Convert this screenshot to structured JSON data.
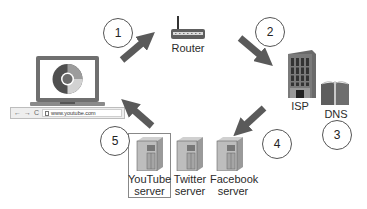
{
  "diagram": {
    "nodes": {
      "laptop": {
        "label": "",
        "icon": "chrome-browser-icon"
      },
      "browser": {
        "nav_buttons": [
          "←",
          "→",
          "C"
        ],
        "url": "www.youtube.com"
      },
      "router": {
        "label": "Router"
      },
      "isp": {
        "label": "ISP"
      },
      "dns": {
        "label": "DNS"
      },
      "servers": [
        {
          "line1": "YouTube",
          "line2": "server",
          "highlighted": true
        },
        {
          "line1": "Twitter",
          "line2": "server",
          "highlighted": false
        },
        {
          "line1": "Facebook",
          "line2": "server",
          "highlighted": false
        }
      ]
    },
    "steps": [
      {
        "number": "1",
        "from": "laptop",
        "to": "router"
      },
      {
        "number": "2",
        "from": "router",
        "to": "isp"
      },
      {
        "number": "3",
        "from": "isp",
        "to": "dns"
      },
      {
        "number": "4",
        "from": "isp",
        "to": "servers"
      },
      {
        "number": "5",
        "from": "servers",
        "to": "browser"
      }
    ],
    "colors": {
      "arrow": "#5a5a5a",
      "circle_border": "#555555",
      "server_body": "#b9b9b9",
      "building": "#6d6d6d",
      "text": "#2b2b2b"
    }
  }
}
